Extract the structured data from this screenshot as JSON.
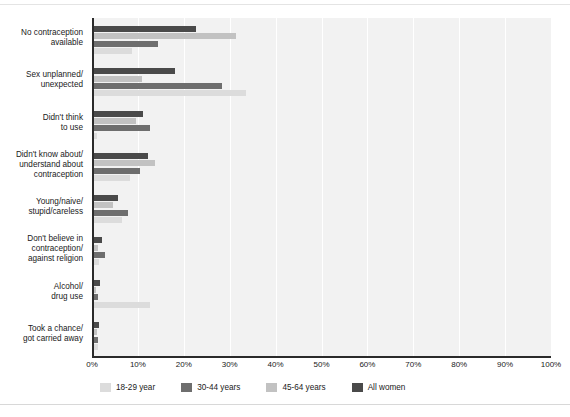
{
  "chart_data": {
    "type": "bar",
    "orientation": "horizontal",
    "title": "",
    "subtitle": "",
    "xlabel": "",
    "ylabel": "",
    "xlim": [
      0,
      100
    ],
    "xtick_labels": [
      "0%",
      "10%",
      "20%",
      "30%",
      "40%",
      "50%",
      "60%",
      "70%",
      "80%",
      "90%",
      "100%"
    ],
    "xtick_values": [
      0,
      10,
      20,
      30,
      40,
      50,
      60,
      70,
      80,
      90,
      100
    ],
    "grid": true,
    "legend_position": "bottom",
    "categories": [
      "No contraception\navailable",
      "Sex unplanned/\nunexpected",
      "Didn't think\nto use",
      "Didn't know about/\nunderstand about\ncontraception",
      "Young/naive/\nstupid/careless",
      "Don't believe in\ncontraception/\nagainst religion",
      "Alcohol/\ndrug use",
      "Took a chance/\ngot carried away"
    ],
    "series": [
      {
        "name": "All women",
        "color": "#4a4a4a",
        "values": [
          22.7,
          18.0,
          11.2,
          12.2,
          5.7,
          2.2,
          1.8,
          1.6
        ]
      },
      {
        "name": "45-64 years",
        "color": "#c2c2c2",
        "values": [
          31.4,
          11.0,
          9.6,
          13.7,
          4.6,
          1.4,
          0.8,
          1.0
        ]
      },
      {
        "name": "30-44 years",
        "color": "#6e6e6e",
        "values": [
          14.4,
          28.3,
          12.6,
          10.5,
          7.9,
          2.8,
          1.4,
          1.4
        ]
      },
      {
        "name": "18-29 year",
        "color": "#dcdcdc",
        "values": [
          8.7,
          33.6,
          1.0,
          8.3,
          6.5,
          1.6,
          12.6,
          1.2
        ]
      }
    ],
    "series_draw_order_top_to_bottom": [
      "All women",
      "45-64 years",
      "30-44 years",
      "18-29 year"
    ]
  },
  "legend": {
    "items": [
      {
        "label": "18-29 year",
        "color": "#dcdcdc"
      },
      {
        "label": "30-44 years",
        "color": "#6e6e6e"
      },
      {
        "label": "45-64 years",
        "color": "#c2c2c2"
      },
      {
        "label": "All women",
        "color": "#4a4a4a"
      }
    ]
  }
}
